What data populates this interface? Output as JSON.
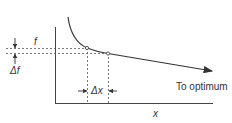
{
  "diagram": {
    "labels": {
      "f": "f",
      "delta_f": "Δf",
      "delta_x": "Δx",
      "to_optimum": "To optimum",
      "x_axis": "x"
    },
    "colors": {
      "line": "#333333",
      "dashed": "#555555",
      "background": "#ffffff"
    }
  }
}
